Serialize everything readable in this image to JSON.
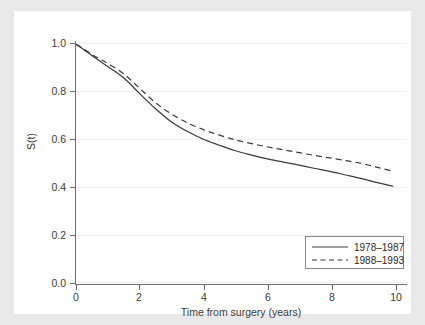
{
  "chart_data": {
    "type": "line",
    "title": "",
    "xlabel": "Time from surgery (years)",
    "ylabel": "S(t)",
    "xlim": [
      0,
      10.4
    ],
    "ylim": [
      0.0,
      1.0
    ],
    "xticks": [
      "0",
      "2",
      "4",
      "6",
      "8",
      "10"
    ],
    "xtick_values": [
      0,
      2,
      4,
      6,
      8,
      10
    ],
    "yticks": [
      "0.0",
      "0.2",
      "0.4",
      "0.6",
      "0.8",
      "1.0"
    ],
    "ytick_values": [
      0.0,
      0.2,
      0.4,
      0.6,
      0.8,
      1.0
    ],
    "grid": true,
    "legend_position": "lower right",
    "x": [
      0,
      0.25,
      0.5,
      0.75,
      1.0,
      1.5,
      2.0,
      2.5,
      3.0,
      3.5,
      4.0,
      4.5,
      5.0,
      5.5,
      6.0,
      6.5,
      7.0,
      7.5,
      8.0,
      8.5,
      9.0,
      9.5,
      10.0
    ],
    "series": [
      {
        "name": "1978–1987",
        "style": "solid",
        "color": "#3a3a3a",
        "values": [
          0.995,
          0.972,
          0.948,
          0.925,
          0.902,
          0.855,
          0.79,
          0.727,
          0.672,
          0.632,
          0.6,
          0.575,
          0.552,
          0.534,
          0.518,
          0.505,
          0.492,
          0.478,
          0.465,
          0.45,
          0.435,
          0.418,
          0.403
        ]
      },
      {
        "name": "1988–1993",
        "style": "dashed",
        "color": "#3a3a3a",
        "values": [
          0.995,
          0.974,
          0.953,
          0.933,
          0.915,
          0.872,
          0.812,
          0.752,
          0.705,
          0.668,
          0.64,
          0.617,
          0.597,
          0.582,
          0.568,
          0.556,
          0.544,
          0.532,
          0.521,
          0.51,
          0.498,
          0.482,
          0.465
        ]
      }
    ]
  },
  "legend": {
    "items": [
      {
        "label": "1978–1987",
        "style": "solid"
      },
      {
        "label": "1988–1993",
        "style": "dashed"
      }
    ]
  },
  "colors": {
    "background": "#e9e9e9",
    "canvas": "#ffffff",
    "axis": "#6f6f6f",
    "grid": "#f0f0f0",
    "line": "#3a3a3a",
    "text": "#3a3a3a"
  }
}
